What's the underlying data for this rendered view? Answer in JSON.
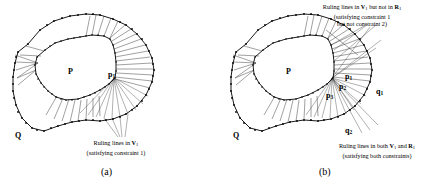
{
  "figure": {
    "type": "geometry-diagram"
  },
  "panel_a": {
    "caption": "(a)",
    "labels": {
      "inner_polygon": "P",
      "outer_polygon": "Q",
      "vertex_p1_text": "p",
      "vertex_p1_sub": "1"
    },
    "annotation": {
      "line1_pre": "Ruling lines in ",
      "line1_bold": "V",
      "line1_sub": "1",
      "line2": "(satisfying constraint 1)"
    }
  },
  "panel_b": {
    "caption": "(b)",
    "labels": {
      "inner_polygon": "P",
      "outer_polygon": "Q",
      "p1_text": "p",
      "p1_sub": "1",
      "p2_text": "p",
      "p2_sub": "2",
      "p3_text": "p",
      "p3_sub": "3",
      "q1_text": "q",
      "q1_sub": "1",
      "q2_text": "q",
      "q2_sub": "2"
    },
    "annotation_top": {
      "line1_pre": "Ruling lines in ",
      "line1_boldV": "V",
      "line1_subV": "1",
      "line1_mid": " but not in ",
      "line1_boldR": "R",
      "line1_subR": "1",
      "line2": "(satisfying constraint 1",
      "line3": "but not constraint 2)"
    },
    "annotation_bottom": {
      "line1_pre": "Ruling lines in both ",
      "line1_boldV": "V",
      "line1_subV": "1",
      "line1_mid": " and ",
      "line1_boldR": "R",
      "line1_subR": "1",
      "line2": "(satisfying both constraints)"
    }
  },
  "colors": {
    "stroke": "#000000",
    "ruling": "#2c2c2c",
    "background": "#ffffff"
  }
}
